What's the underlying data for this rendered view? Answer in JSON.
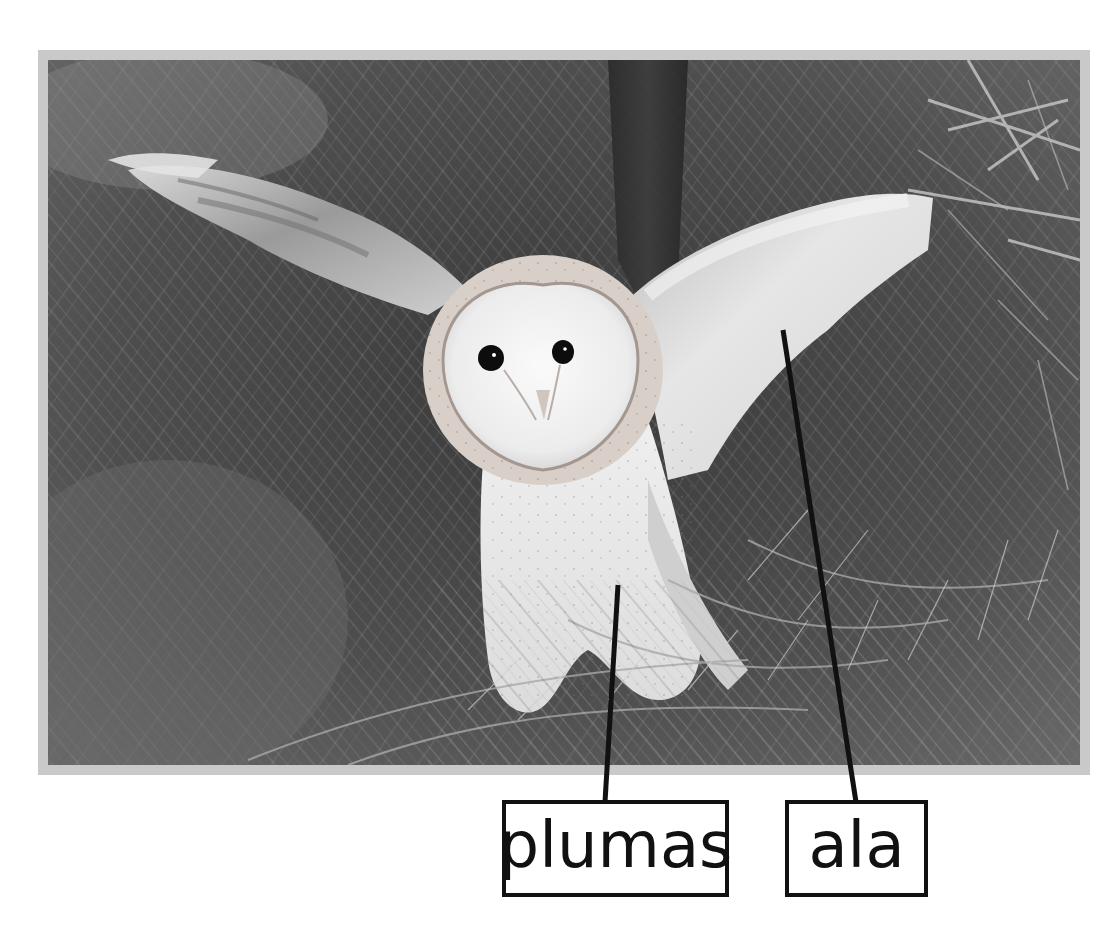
{
  "figure": {
    "type": "labeled-photo",
    "style": "grayscale photograph with gray border",
    "frame_color": "#c9c9c9",
    "labels": [
      {
        "id": "plumas",
        "text": "plumas",
        "points_to": "chest feathers",
        "line_color": "#111111"
      },
      {
        "id": "ala",
        "text": "ala",
        "points_to": "wing",
        "line_color": "#111111"
      }
    ]
  }
}
